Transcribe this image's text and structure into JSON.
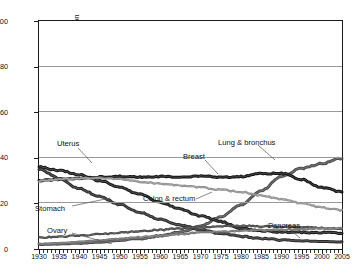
{
  "panel": {
    "letter": "B"
  },
  "axes": {
    "ylabel": "Rate per 100,000 female population",
    "yticks": [
      "0",
      "20",
      "40",
      "60",
      "80",
      "100"
    ],
    "xticks": [
      "1930",
      "1935",
      "1940",
      "1945",
      "1950",
      "1955",
      "1960",
      "1965",
      "1970",
      "1975",
      "1980",
      "1985",
      "1990",
      "1995",
      "2000",
      "2005"
    ]
  },
  "labels": {
    "uterus": "Uterus",
    "stomach": "Stomach",
    "ovary": "Ovary",
    "breast": "Breast",
    "lung": "Lung & bronchus",
    "colon": "Colon & rectum",
    "pancreas": "Pancreas"
  },
  "chart_data": {
    "type": "line",
    "title": "",
    "xlabel": "",
    "ylabel": "Rate per 100,000 female population",
    "xlim": [
      1930,
      2005
    ],
    "ylim": [
      0,
      100
    ],
    "grid": true,
    "legend": "inline-annotations",
    "x": [
      1930,
      1935,
      1940,
      1945,
      1950,
      1955,
      1960,
      1965,
      1970,
      1975,
      1980,
      1985,
      1990,
      1995,
      2000,
      2005
    ],
    "series": [
      {
        "name": "Lung & bronchus",
        "color": "#4d4d4d",
        "values": [
          2.0,
          2.2,
          2.5,
          3.0,
          3.8,
          4.6,
          5.8,
          7.3,
          10.1,
          14.0,
          19.5,
          25.5,
          31.8,
          35.3,
          37.5,
          39.8
        ]
      },
      {
        "name": "Breast",
        "color": "#111111",
        "values": [
          30.0,
          30.6,
          31.0,
          31.5,
          31.8,
          31.5,
          31.8,
          31.5,
          32.0,
          31.5,
          31.8,
          33.0,
          33.2,
          30.5,
          27.0,
          25.0
        ]
      },
      {
        "name": "Uterus",
        "color": "#1a1a1a",
        "values": [
          36.0,
          34.5,
          32.5,
          30.0,
          27.0,
          24.0,
          20.5,
          17.5,
          14.5,
          12.0,
          9.0,
          8.0,
          7.5,
          7.3,
          7.2,
          7.0
        ]
      },
      {
        "name": "Stomach",
        "color": "#2b2b2b",
        "values": [
          35.0,
          31.0,
          26.5,
          23.0,
          19.5,
          16.0,
          13.0,
          10.5,
          8.5,
          6.8,
          5.5,
          4.6,
          4.0,
          3.6,
          3.3,
          3.1
        ]
      },
      {
        "name": "Colon & rectum",
        "color": "#8a8a8a",
        "values": [
          29.8,
          30.5,
          31.0,
          31.2,
          30.5,
          29.5,
          28.6,
          27.8,
          27.0,
          26.0,
          25.0,
          23.5,
          21.8,
          20.0,
          18.2,
          17.0
        ]
      },
      {
        "name": "Ovary",
        "color": "#3a3a3a",
        "values": [
          5.0,
          5.4,
          5.9,
          6.5,
          7.2,
          7.8,
          8.4,
          9.0,
          9.6,
          10.0,
          10.2,
          10.0,
          9.8,
          9.6,
          9.2,
          8.8
        ]
      },
      {
        "name": "Pancreas",
        "color": "#6b6b6b",
        "values": [
          2.2,
          2.6,
          3.2,
          3.8,
          4.5,
          5.2,
          5.9,
          6.5,
          7.2,
          7.6,
          8.0,
          8.3,
          8.5,
          8.7,
          8.9,
          9.1
        ]
      }
    ]
  }
}
